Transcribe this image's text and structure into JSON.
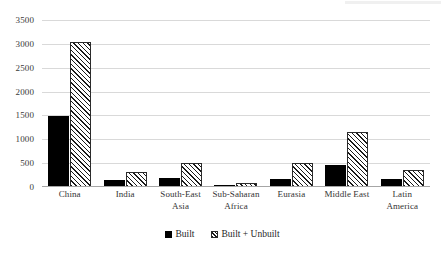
{
  "chart_data": {
    "type": "bar",
    "title": "",
    "subtitle": "",
    "xlabel": "",
    "ylabel": "",
    "ylim": [
      0,
      3500
    ],
    "ytick_step": 500,
    "yticks": [
      3500,
      3000,
      2500,
      2000,
      1500,
      1000,
      500,
      0
    ],
    "ytick_labels": [
      "3500",
      "3000",
      "2500",
      "2000",
      "1500",
      "1000",
      "500",
      "0"
    ],
    "grid": true,
    "legend_position": "bottom",
    "categories": [
      "China",
      "India",
      "South-East Asia",
      "Sub-Saharan Africa",
      "Eurasia",
      "Middle East",
      "Latin America"
    ],
    "category_lines": [
      [
        "China",
        ""
      ],
      [
        "India",
        ""
      ],
      [
        "South-East",
        "Asia"
      ],
      [
        "Sub-Saharan",
        "Africa"
      ],
      [
        "Eurasia",
        ""
      ],
      [
        "Middle East",
        ""
      ],
      [
        "Latin",
        "America"
      ]
    ],
    "series": [
      {
        "name": "Built",
        "color": "#000000",
        "pattern": "solid",
        "values": [
          1495,
          140,
          185,
          40,
          165,
          470,
          175
        ]
      },
      {
        "name": "Built + Unbuilt",
        "color": "#ffffff",
        "pattern": "diagonal-hatch",
        "values": [
          3040,
          310,
          510,
          75,
          495,
          1160,
          355
        ]
      }
    ]
  },
  "legend": {
    "entries": [
      {
        "label": "Built",
        "swatch": "solid-black-square"
      },
      {
        "label": "Built + Unbuilt",
        "swatch": "hatched-square"
      }
    ]
  },
  "colors": {
    "gridline": "#d9d9d9",
    "axis": "#a6a6a6",
    "text": "#262626",
    "series_built": "#000000",
    "series_unbuilt_outline": "#2b2b2b",
    "background": "#ffffff"
  }
}
